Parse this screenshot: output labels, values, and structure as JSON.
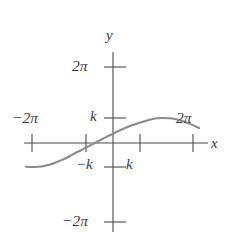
{
  "figure": {
    "background_color": "#ffffff",
    "axis_color": "#4a4a4a",
    "curve_color": "#8a8a8a",
    "text_color": "#3a3a3a",
    "axis_labels": {
      "y": "y",
      "x": "x"
    },
    "y_axis_ticks": [
      {
        "name": "tick-2pi-y",
        "label": "2π"
      },
      {
        "name": "tick-k-y",
        "label": "k"
      },
      {
        "name": "tick-neg-k-y",
        "label": "−k"
      },
      {
        "name": "tick-neg-2pi-y",
        "label": "−2π"
      }
    ],
    "x_axis_ticks": [
      {
        "name": "tick-neg-2pi-x",
        "label": "−2π"
      },
      {
        "name": "tick-2pi-x",
        "label": "2π"
      },
      {
        "name": "tick-k-x",
        "label": "k"
      }
    ]
  },
  "chart_data": {
    "type": "line",
    "title": "",
    "xlabel": "x",
    "ylabel": "y",
    "grid": false,
    "legend": null,
    "xlim": [
      -2.6,
      2.6
    ],
    "ylim": [
      -2.6,
      2.6
    ],
    "x_tick_labels": [
      "−2π",
      "−k",
      "k",
      "2π"
    ],
    "x_tick_values": [
      -2,
      -1,
      1,
      2
    ],
    "y_tick_labels": [
      "2π",
      "k",
      "−k",
      "−2π"
    ],
    "y_tick_values": [
      2,
      1,
      -1,
      -2
    ],
    "annotations": [
      "k",
      "−k",
      "k"
    ],
    "series": [
      {
        "name": "wave",
        "comment": "sinusoid: y = -k*cos(pi*x) shape, amplitude k, period 2 units; troughs at x=-2,0,2 and peaks at x=-1,1 in tick units",
        "x": [
          -2.6,
          -2.45,
          -2.3,
          -2.15,
          -2.0,
          -1.85,
          -1.7,
          -1.55,
          -1.4,
          -1.25,
          -1.1,
          -1.0,
          -0.9,
          -0.75,
          -0.6,
          -0.45,
          -0.3,
          -0.15,
          0.0,
          0.15,
          0.3,
          0.45,
          0.6,
          0.75,
          0.9,
          1.0,
          1.1,
          1.25,
          1.4,
          1.55,
          1.7,
          1.85,
          2.0,
          2.15,
          2.3,
          2.45,
          2.6
        ],
        "y": [
          -0.81,
          -0.9,
          -0.96,
          -0.99,
          -1.0,
          -0.99,
          -0.96,
          -0.9,
          -0.81,
          -0.71,
          -0.59,
          -0.5,
          -0.41,
          -0.29,
          -0.16,
          -0.03,
          0.1,
          0.23,
          0.35,
          0.47,
          0.58,
          0.68,
          0.77,
          0.85,
          0.92,
          0.96,
          0.99,
          1.0,
          0.99,
          0.96,
          0.9,
          0.81,
          0.71,
          0.59,
          0.45,
          0.3,
          0.14
        ]
      }
    ]
  }
}
